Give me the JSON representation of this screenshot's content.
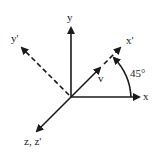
{
  "diagram": {
    "title": "",
    "axes": {
      "x": {
        "label": "x",
        "style": "solid"
      },
      "y": {
        "label": "y",
        "style": "solid"
      },
      "z": {
        "label": "z, z'",
        "style": "solid"
      },
      "x_prime": {
        "label": "x'",
        "style": "dashed"
      },
      "y_prime": {
        "label": "y'",
        "style": "dashed"
      }
    },
    "vector": {
      "label": "v"
    },
    "angle": {
      "label": "45°",
      "value_degrees": 45
    },
    "colors": {
      "line": "#1a1a1a",
      "background": "#ffffff"
    }
  }
}
